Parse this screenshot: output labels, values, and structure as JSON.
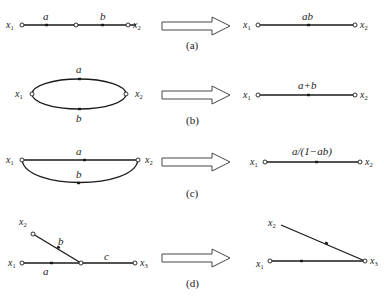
{
  "figure": {
    "panels": [
      {
        "caption": "(a)",
        "rule": "series",
        "left": {
          "nodes": [
            "x1",
            "x2"
          ],
          "gains": [
            "a",
            "b"
          ]
        },
        "right": {
          "nodes": [
            "x1",
            "x2"
          ],
          "gain": "ab"
        }
      },
      {
        "caption": "(b)",
        "rule": "parallel",
        "left": {
          "nodes": [
            "x1",
            "x2"
          ],
          "gains": [
            "a",
            "b"
          ]
        },
        "right": {
          "nodes": [
            "x1",
            "x2"
          ],
          "gain": "a+b"
        }
      },
      {
        "caption": "(c)",
        "rule": "loop",
        "left": {
          "nodes": [
            "x1",
            "x2"
          ],
          "gains": [
            "a",
            "b"
          ]
        },
        "right": {
          "nodes": [
            "x1",
            "x2"
          ],
          "gain": "a/(1−ab)"
        }
      },
      {
        "caption": "(d)",
        "rule": "node elimination",
        "left": {
          "nodes": [
            "x1",
            "x2",
            "x3"
          ],
          "gains": [
            "a",
            "b",
            "c"
          ]
        },
        "right": {
          "nodes": [
            "x1",
            "x2",
            "x3"
          ]
        }
      }
    ],
    "labels": {
      "x": "x",
      "s1": "1",
      "s2": "2",
      "s3": "3",
      "a": "a",
      "b": "b",
      "c": "c",
      "ab": "ab",
      "apb": "a+b",
      "loop": "a/(1−ab)",
      "cap_a": "(a)",
      "cap_b": "(b)",
      "cap_c": "(c)",
      "cap_d": "(d)"
    }
  }
}
